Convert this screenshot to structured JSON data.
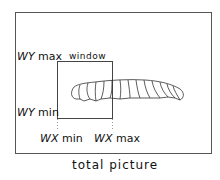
{
  "diagram": {
    "caption": "total picture",
    "window_label": "window",
    "labels": {
      "wy_max": {
        "var": "WY",
        "suffix": "max"
      },
      "wy_min": {
        "var": "WY",
        "suffix": "min"
      },
      "wx_min": {
        "var": "WX",
        "suffix": "min"
      },
      "wx_max": {
        "var": "WX",
        "suffix": "max"
      }
    },
    "figure": "caterpillar"
  }
}
